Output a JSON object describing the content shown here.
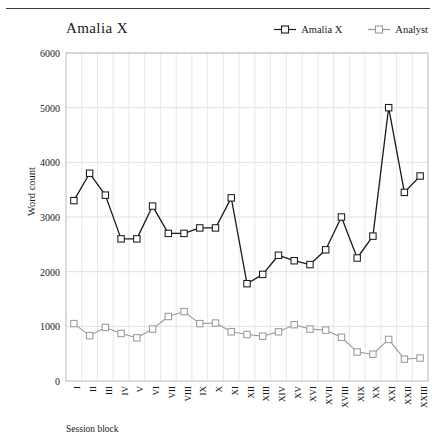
{
  "figure": {
    "title": "Amalia X",
    "xlabel": "Session block",
    "ylabel": "Word count"
  },
  "legend": [
    {
      "label": "Amalia X",
      "color": "#1a1a1a",
      "marker": "square-line"
    },
    {
      "label": "Analyst",
      "color": "#9a9a9a",
      "marker": "square-line"
    }
  ],
  "axes": {
    "y_ticks": [
      "6000",
      "5000",
      "4000",
      "3000",
      "2000",
      "1000",
      "0"
    ],
    "x_ticks": [
      "I",
      "II",
      "III",
      "IV",
      "V",
      "VI",
      "VII",
      "VIII",
      "IX",
      "X",
      "XI",
      "XII",
      "XIII",
      "XIV",
      "XV",
      "XVI",
      "XVII",
      "XVIII",
      "XIX",
      "XX",
      "XXI",
      "XXII",
      "XXIII"
    ]
  },
  "chart_data": {
    "type": "line",
    "title": "Amalia X",
    "xlabel": "Session block",
    "ylabel": "Word count",
    "ylim": [
      0,
      6000
    ],
    "ytick_step": 1000,
    "grid": true,
    "legend_position": "top-right",
    "categories": [
      "I",
      "II",
      "III",
      "IV",
      "V",
      "VI",
      "VII",
      "VIII",
      "IX",
      "X",
      "XI",
      "XII",
      "XIII",
      "XIV",
      "XV",
      "XVI",
      "XVII",
      "XVIII",
      "XIX",
      "XX",
      "XXI",
      "XXII",
      "XXIII"
    ],
    "series": [
      {
        "name": "Amalia X",
        "color": "#1a1a1a",
        "values": [
          3300,
          3800,
          3400,
          2600,
          2600,
          3200,
          2700,
          2700,
          2800,
          2800,
          3350,
          1780,
          1950,
          2300,
          2200,
          2130,
          2400,
          3000,
          2250,
          2650,
          5000,
          3450,
          3750
        ]
      },
      {
        "name": "Analyst",
        "color": "#9a9a9a",
        "values": [
          1050,
          830,
          980,
          870,
          790,
          950,
          1180,
          1270,
          1050,
          1060,
          900,
          850,
          820,
          900,
          1030,
          950,
          930,
          800,
          530,
          490,
          760,
          400,
          420
        ]
      }
    ]
  }
}
